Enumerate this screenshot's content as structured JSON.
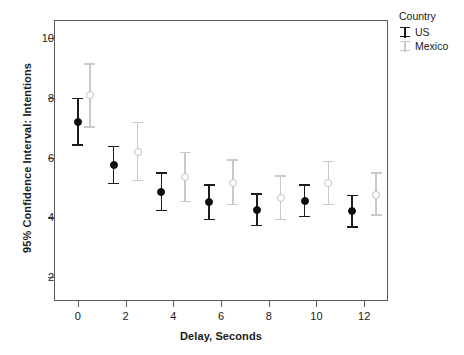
{
  "chart_data": {
    "type": "scatter",
    "title": "",
    "xlabel": "Delay, Seconds",
    "ylabel": "95% Confidence Interval: Intentions",
    "xlim": [
      -1,
      13
    ],
    "ylim": [
      1.2,
      10.6
    ],
    "xticks": [
      "0",
      "2",
      "4",
      "6",
      "8",
      "10",
      "12"
    ],
    "xtick_values": [
      0,
      2,
      4,
      6,
      8,
      10,
      12
    ],
    "yticks": [
      "2",
      "4",
      "6",
      "8",
      "10"
    ],
    "ytick_values": [
      2,
      4,
      6,
      8,
      10
    ],
    "grid": false,
    "legend_position": "right-top",
    "legend_title": "Country",
    "series": [
      {
        "name": "US",
        "color": "#1c1c1c",
        "marker": "filled-circle",
        "x": [
          0.0,
          1.5,
          3.5,
          5.5,
          7.5,
          9.5,
          11.5
        ],
        "values": [
          7.2,
          5.75,
          4.85,
          4.5,
          4.25,
          4.55,
          4.2
        ],
        "ci_lower": [
          6.4,
          5.1,
          4.2,
          3.9,
          3.7,
          4.0,
          3.65
        ],
        "ci_upper": [
          8.0,
          6.4,
          5.5,
          5.1,
          4.8,
          5.1,
          4.75
        ]
      },
      {
        "name": "Mexico",
        "color": "#c9c9c9",
        "marker": "open-circle",
        "x": [
          0.5,
          2.5,
          4.5,
          6.5,
          8.5,
          10.5,
          12.5
        ],
        "values": [
          8.1,
          6.2,
          5.35,
          5.15,
          4.65,
          5.15,
          4.75
        ],
        "ci_lower": [
          7.0,
          5.2,
          4.5,
          4.4,
          3.9,
          4.4,
          4.05
        ],
        "ci_upper": [
          9.15,
          7.2,
          6.2,
          5.95,
          5.4,
          5.9,
          5.5
        ]
      }
    ]
  },
  "legend": {
    "title": "Country",
    "entries": [
      {
        "label": "US",
        "color": "#1c1c1c"
      },
      {
        "label": "Mexico",
        "color": "#c9c9c9"
      }
    ]
  },
  "axes": {
    "x_title": "Delay, Seconds",
    "y_title": "95% Confidence Interval: Intentions"
  }
}
